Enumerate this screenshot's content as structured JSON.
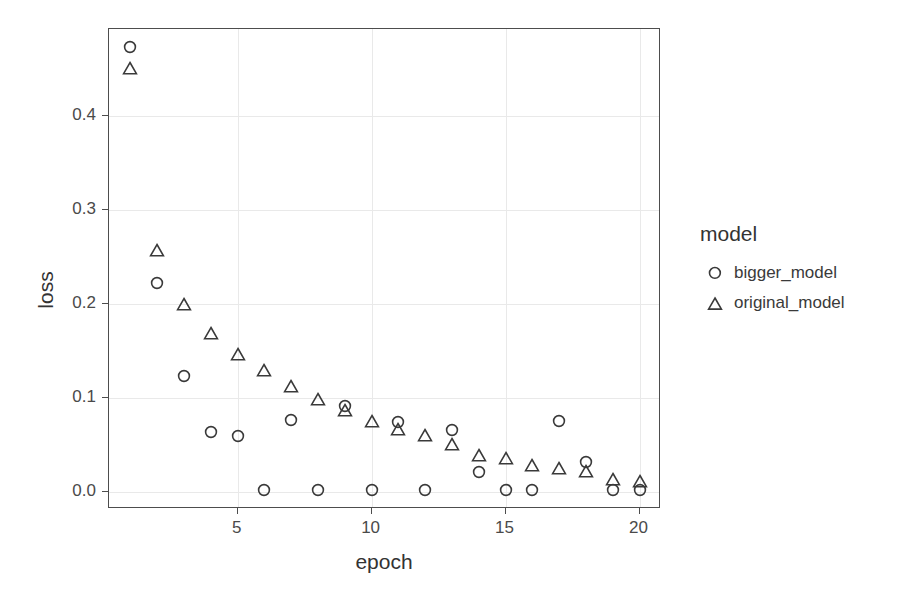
{
  "chart_data": {
    "type": "scatter",
    "title": "",
    "xlabel": "epoch",
    "ylabel": "loss",
    "xlim": [
      0.2,
      20.8
    ],
    "ylim": [
      -0.018,
      0.492
    ],
    "xticks": [
      5,
      10,
      15,
      20
    ],
    "xtick_labels": [
      "5",
      "10",
      "15",
      "20"
    ],
    "yticks": [
      0.0,
      0.1,
      0.2,
      0.3,
      0.4
    ],
    "ytick_labels": [
      "0.0",
      "0.1",
      "0.2",
      "0.3",
      "0.4"
    ],
    "grid": true,
    "legend_position": "right",
    "legend_title": "model",
    "x": [
      1,
      2,
      3,
      4,
      5,
      6,
      7,
      8,
      9,
      10,
      11,
      12,
      13,
      14,
      15,
      16,
      17,
      18,
      19,
      20
    ],
    "series": [
      {
        "name": "bigger_model",
        "marker": "circle",
        "color": "#3a3a3a",
        "values": [
          0.473,
          0.222,
          0.123,
          0.064,
          0.06,
          0.002,
          0.077,
          0.002,
          0.091,
          0.002,
          0.074,
          0.002,
          0.066,
          0.021,
          0.002,
          0.002,
          0.075,
          0.032,
          0.002,
          0.002
        ]
      },
      {
        "name": "original_model",
        "marker": "triangle",
        "color": "#3a3a3a",
        "values": [
          0.452,
          0.258,
          0.201,
          0.17,
          0.148,
          0.131,
          0.114,
          0.1,
          0.088,
          0.077,
          0.068,
          0.062,
          0.052,
          0.04,
          0.037,
          0.03,
          0.027,
          0.023,
          0.015,
          0.013
        ]
      }
    ]
  },
  "legend": {
    "title": "model",
    "entries": [
      {
        "label": "bigger_model",
        "marker": "circle-marker-icon"
      },
      {
        "label": "original_model",
        "marker": "triangle-marker-icon"
      }
    ]
  },
  "style": {
    "panel_border": "#4d4d4d",
    "grid_color": "#e9e9e9",
    "marker_color": "#3a3a3a",
    "text_color": "#3a3a3a",
    "background": "#ffffff"
  }
}
